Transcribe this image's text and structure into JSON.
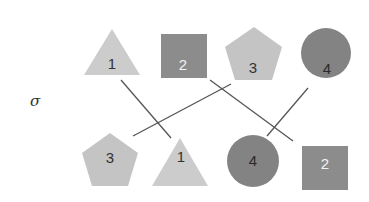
{
  "diagram": {
    "symbol": "σ",
    "colors": {
      "triangle": "#cccccc",
      "square": "#8c8c8c",
      "pentagon": "#c4c4c4",
      "circle": "#838383",
      "line": "#555555",
      "dark_text": "#333333",
      "light_text": "#f2f2f2"
    },
    "top_row": [
      {
        "shape": "triangle",
        "label": "1"
      },
      {
        "shape": "square",
        "label": "2"
      },
      {
        "shape": "pentagon",
        "label": "3"
      },
      {
        "shape": "circle",
        "label": "4"
      }
    ],
    "bottom_row": [
      {
        "shape": "pentagon",
        "label": "3"
      },
      {
        "shape": "triangle",
        "label": "1"
      },
      {
        "shape": "circle",
        "label": "4"
      },
      {
        "shape": "square",
        "label": "2"
      }
    ],
    "mapping": [
      {
        "from": "1",
        "to": "1"
      },
      {
        "from": "2",
        "to": "2"
      },
      {
        "from": "3",
        "to": "3"
      },
      {
        "from": "4",
        "to": "4"
      }
    ]
  }
}
